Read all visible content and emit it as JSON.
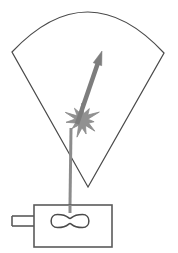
{
  "figure": {
    "description": "Line drawing: a particle travels upward from a source device into an interaction point where a burst occurs and a deflected vector exits within an angular acceptance cone.",
    "canvas": {
      "width": 178,
      "height": 253,
      "background": "#ffffff"
    },
    "colors": {
      "outline": "#4a4a4a",
      "cone_stroke": "#4a4a4a",
      "beam_line": "#8c8c8c",
      "burst_fill": "#919191",
      "burst_stroke": "#8a8a8a",
      "vector_arrow": "#7d7d7d",
      "box_stroke": "#5a5a5a",
      "filament_stroke": "#4a4a4a",
      "background": "#ffffff"
    },
    "elements": {
      "acceptance_cone": {
        "label": "acceptance cone",
        "apex": {
          "x": 88,
          "y": 187
        },
        "left_corner": {
          "x": 12,
          "y": 52
        },
        "right_corner": {
          "x": 164,
          "y": 53
        },
        "arc_peak": {
          "x": 88,
          "y": 12
        },
        "stroke_width": 1.2
      },
      "incident_beam": {
        "label": "incident beam line",
        "start": {
          "x": 70,
          "y": 213
        },
        "end": {
          "x": 71,
          "y": 128
        },
        "stroke_width": 3
      },
      "interaction_burst": {
        "label": "interaction burst",
        "center": {
          "x": 82,
          "y": 120
        },
        "outer_radius": 17,
        "inner_radius": 7,
        "points": 11
      },
      "scattered_vector": {
        "label": "scattered particle vector",
        "tail": {
          "x": 77,
          "y": 124
        },
        "head": {
          "x": 102,
          "y": 51
        },
        "stroke_width": 4.5,
        "arrowhead_length": 14,
        "arrowhead_width": 9
      },
      "source_box": {
        "label": "source housing",
        "x": 34,
        "y": 205,
        "width": 78,
        "height": 42,
        "stroke_width": 1.6
      },
      "connector_stub": {
        "label": "electrical connector",
        "upper_line_y": 216,
        "lower_line_y": 226,
        "x_start": 12,
        "x_end": 34,
        "stroke_width": 1.6
      },
      "filament": {
        "label": "filament element",
        "center": {
          "x": 70,
          "y": 221
        },
        "width": 38,
        "height": 13,
        "stroke_width": 1.5
      }
    }
  }
}
